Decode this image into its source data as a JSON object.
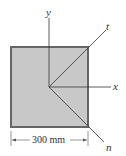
{
  "diagram": {
    "plate": {
      "shape": "square",
      "fill": "#c8c8c8",
      "border": "#555555"
    },
    "axes": {
      "y": "y",
      "x": "x",
      "t": "t",
      "n": "n"
    },
    "dimension": {
      "label": "300 mm"
    }
  }
}
